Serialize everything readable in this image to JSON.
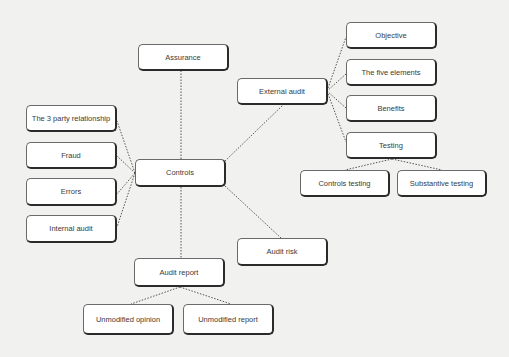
{
  "diagram": {
    "type": "mind-map",
    "central": "controls",
    "nodes": [
      {
        "id": "assurance",
        "label": "Assurance",
        "x": 138,
        "y": 44,
        "w": 91,
        "h": 27
      },
      {
        "id": "external-audit",
        "label": "External audit",
        "x": 237,
        "y": 78,
        "w": 91,
        "h": 27
      },
      {
        "id": "objective",
        "label": "Objective",
        "x": 346,
        "y": 22,
        "w": 91,
        "h": 27
      },
      {
        "id": "five-elements",
        "label": "The five elements",
        "x": 346,
        "y": 59,
        "w": 91,
        "h": 27
      },
      {
        "id": "benefits",
        "label": "Benefits",
        "x": 346,
        "y": 95,
        "w": 91,
        "h": 27
      },
      {
        "id": "testing",
        "label": "Testing",
        "x": 346,
        "y": 132,
        "w": 91,
        "h": 27
      },
      {
        "id": "controls-testing",
        "label": "Controls testing",
        "x": 300,
        "y": 170,
        "w": 90,
        "h": 27
      },
      {
        "id": "substantive-testing",
        "label": "Substantive testing",
        "x": 397,
        "y": 170,
        "w": 90,
        "h": 27
      },
      {
        "id": "three-party",
        "label": "The 3 party relationship",
        "x": 26,
        "y": 105,
        "w": 91,
        "h": 27
      },
      {
        "id": "fraud",
        "label": "Fraud",
        "x": 26,
        "y": 142,
        "w": 91,
        "h": 27
      },
      {
        "id": "errors",
        "label": "Errors",
        "x": 26,
        "y": 178,
        "w": 91,
        "h": 28
      },
      {
        "id": "internal-audit",
        "label": "Internal audit",
        "x": 26,
        "y": 215,
        "w": 91,
        "h": 28
      },
      {
        "id": "controls",
        "label": "Controls",
        "x": 135,
        "y": 159,
        "w": 91,
        "h": 28
      },
      {
        "id": "audit-risk",
        "label": "Audit risk",
        "x": 237,
        "y": 238,
        "w": 91,
        "h": 28
      },
      {
        "id": "audit-report",
        "label": "Audit report",
        "x": 134,
        "y": 258,
        "w": 91,
        "h": 29
      },
      {
        "id": "unmodified-opinion",
        "label": "Unmodified opinion",
        "x": 83,
        "y": 304,
        "w": 91,
        "h": 31
      },
      {
        "id": "unmodified-report",
        "label": "Unmodified report",
        "x": 183,
        "y": 304,
        "w": 91,
        "h": 31
      }
    ],
    "edges": [
      {
        "from": "controls",
        "to": "assurance",
        "x1": 181,
        "y1": 159,
        "x2": 181,
        "y2": 71
      },
      {
        "from": "controls",
        "to": "external-audit",
        "x1": 225,
        "y1": 161,
        "x2": 283,
        "y2": 105
      },
      {
        "from": "controls",
        "to": "three-party",
        "x1": 135,
        "y1": 173,
        "x2": 117,
        "y2": 121
      },
      {
        "from": "controls",
        "to": "fraud",
        "x1": 135,
        "y1": 173,
        "x2": 117,
        "y2": 156
      },
      {
        "from": "controls",
        "to": "errors",
        "x1": 135,
        "y1": 173,
        "x2": 117,
        "y2": 194
      },
      {
        "from": "controls",
        "to": "internal-audit",
        "x1": 135,
        "y1": 173,
        "x2": 117,
        "y2": 227
      },
      {
        "from": "controls",
        "to": "audit-report",
        "x1": 181,
        "y1": 187,
        "x2": 181,
        "y2": 258
      },
      {
        "from": "controls",
        "to": "audit-risk",
        "x1": 225,
        "y1": 186,
        "x2": 281,
        "y2": 238
      },
      {
        "from": "external-audit",
        "to": "objective",
        "x1": 327,
        "y1": 91,
        "x2": 346,
        "y2": 37
      },
      {
        "from": "external-audit",
        "to": "five-elements",
        "x1": 327,
        "y1": 91,
        "x2": 346,
        "y2": 74
      },
      {
        "from": "external-audit",
        "to": "benefits",
        "x1": 327,
        "y1": 91,
        "x2": 346,
        "y2": 108
      },
      {
        "from": "external-audit",
        "to": "testing",
        "x1": 327,
        "y1": 91,
        "x2": 346,
        "y2": 142
      },
      {
        "from": "testing",
        "to": "controls-testing",
        "x1": 392,
        "y1": 159,
        "x2": 345,
        "y2": 170
      },
      {
        "from": "testing",
        "to": "substantive-testing",
        "x1": 392,
        "y1": 159,
        "x2": 442,
        "y2": 170
      },
      {
        "from": "audit-report",
        "to": "unmodified-opinion",
        "x1": 180,
        "y1": 287,
        "x2": 131,
        "y2": 304
      },
      {
        "from": "audit-report",
        "to": "unmodified-report",
        "x1": 180,
        "y1": 287,
        "x2": 231,
        "y2": 304
      }
    ]
  },
  "labels": {
    "assurance": "Assurance",
    "external_audit": "External audit",
    "objective": "Objective",
    "five_elements": "The five elements",
    "benefits": "Benefits",
    "testing": "Testing",
    "controls_testing": "Controls testing",
    "substantive_testing": "Substantive testing",
    "three_party": "The 3 party relationship",
    "fraud": "Fraud",
    "errors": "Errors",
    "internal_audit": "Internal audit",
    "controls": "Controls",
    "audit_risk": "Audit risk",
    "audit_report": "Audit report",
    "unmodified_opinion": "Unmodified opinion",
    "unmodified_report": "Unmodified report"
  },
  "colors": {
    "background": "#f1f1ef",
    "node_fill": "#ffffff",
    "node_border": "#2b2b2b",
    "connector": "#555555",
    "text": "#3a3a3a"
  }
}
